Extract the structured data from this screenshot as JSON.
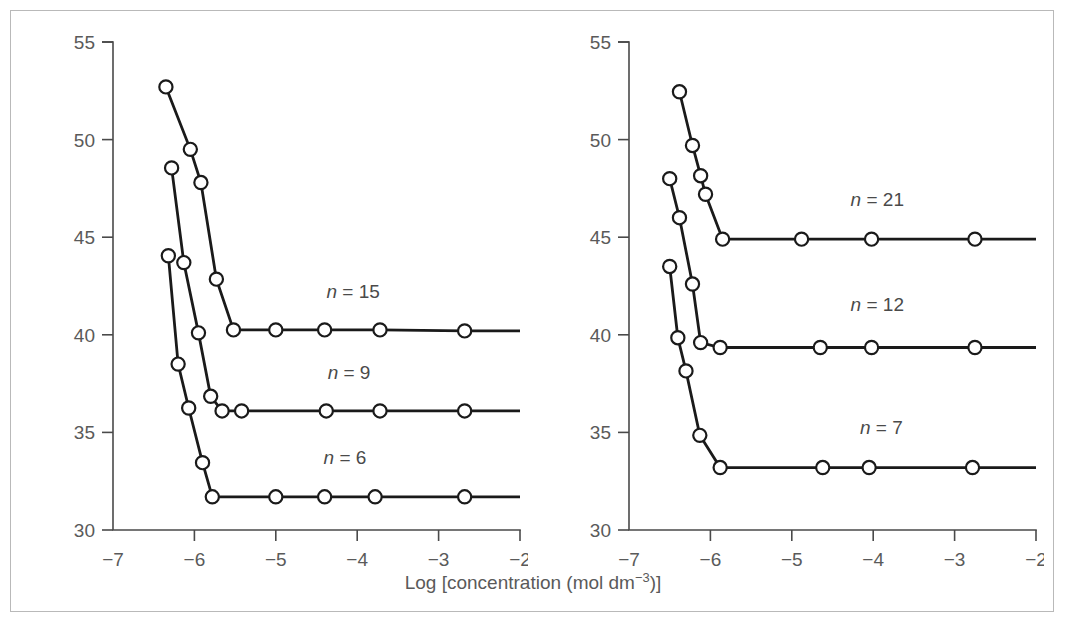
{
  "chart_data": {
    "type": "line",
    "title": "",
    "xlabel": "Log [concentration (mol dm−3)]",
    "ylabel": "γ(mN m−1)",
    "xlim": [
      -7,
      -2
    ],
    "ylim": [
      30,
      55
    ],
    "xticks": [
      -7,
      -6,
      -5,
      -4,
      -3,
      -2
    ],
    "xtick_labels": [
      "−7",
      "−6",
      "−5",
      "−4",
      "−3",
      "−2"
    ],
    "yticks": [
      30,
      35,
      40,
      45,
      50,
      55
    ],
    "ytick_labels": [
      "30",
      "35",
      "40",
      "45",
      "50",
      "55"
    ],
    "grid": false,
    "legend_position": "inline-right-of-plateau",
    "marker": "open-circle",
    "panels": [
      {
        "panel_id": "left",
        "series": [
          {
            "name": "n = 15",
            "label_prefix": "n",
            "label_eq": "=",
            "label_value": "15",
            "label_x": -4.05,
            "label_y": 41.9,
            "x": [
              -6.35,
              -6.05,
              -5.92,
              -5.73,
              -5.52,
              -5.0,
              -4.4,
              -3.72,
              -2.68
            ],
            "y": [
              52.7,
              49.5,
              47.8,
              42.85,
              40.25,
              40.25,
              40.25,
              40.25,
              40.2
            ]
          },
          {
            "name": "n = 9",
            "label_prefix": "n",
            "label_eq": "=",
            "label_value": "9",
            "label_x": -4.1,
            "label_y": 37.75,
            "x": [
              -6.28,
              -6.13,
              -5.95,
              -5.8,
              -5.66,
              -5.42,
              -4.38,
              -3.72,
              -2.68
            ],
            "y": [
              48.55,
              43.7,
              40.1,
              36.85,
              36.1,
              36.1,
              36.1,
              36.1,
              36.1
            ]
          },
          {
            "name": "n = 6",
            "label_prefix": "n",
            "label_eq": "=",
            "label_value": "6",
            "label_x": -4.15,
            "label_y": 33.4,
            "x": [
              -6.32,
              -6.2,
              -6.07,
              -5.9,
              -5.78,
              -5.0,
              -4.4,
              -3.78,
              -2.68
            ],
            "y": [
              44.05,
              38.5,
              36.25,
              33.45,
              31.7,
              31.7,
              31.7,
              31.7,
              31.7
            ]
          }
        ]
      },
      {
        "panel_id": "right",
        "series": [
          {
            "name": "n = 21",
            "label_prefix": "n",
            "label_eq": "=",
            "label_value": "21",
            "label_x": -3.95,
            "label_y": 46.6,
            "x": [
              -6.38,
              -6.22,
              -6.12,
              -6.06,
              -5.85,
              -4.88,
              -4.02,
              -2.75
            ],
            "y": [
              52.45,
              49.7,
              48.15,
              47.2,
              44.9,
              44.9,
              44.9,
              44.9
            ]
          },
          {
            "name": "n = 12",
            "label_prefix": "n",
            "label_eq": "=",
            "label_value": "12",
            "label_x": -3.95,
            "label_y": 41.2,
            "x": [
              -6.5,
              -6.38,
              -6.22,
              -6.12,
              -5.88,
              -4.65,
              -4.02,
              -2.75
            ],
            "y": [
              48.0,
              46.0,
              42.6,
              39.6,
              39.35,
              39.35,
              39.35,
              39.35
            ]
          },
          {
            "name": "n = 7",
            "label_prefix": "n",
            "label_eq": "=",
            "label_value": "7",
            "label_x": -3.9,
            "label_y": 34.9,
            "x": [
              -6.5,
              -6.4,
              -6.3,
              -6.13,
              -5.88,
              -4.62,
              -4.05,
              -2.78
            ],
            "y": [
              43.5,
              39.85,
              38.15,
              34.85,
              33.2,
              33.2,
              33.2,
              33.2
            ]
          }
        ]
      }
    ]
  },
  "colors": {
    "axis": "#4a4a4a",
    "data_line": "#1a1a1a",
    "marker_fill": "#ffffff",
    "text": "#5a5a5a",
    "frame": "#b9b9b9",
    "background": "#ffffff"
  }
}
